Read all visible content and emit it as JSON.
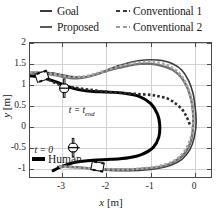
{
  "legend": {
    "items": [
      {
        "label": "Goal",
        "style": "solid",
        "color": "#3a3a3a",
        "icon": "line-solid-dark"
      },
      {
        "label": "Conventional 1",
        "style": "dashed",
        "color": "#3a3a3a",
        "icon": "line-dashed-dark"
      },
      {
        "label": "Proposed",
        "style": "solid",
        "color": "#5a5a5a",
        "icon": "line-solid-gray"
      },
      {
        "label": "Conventional 2",
        "style": "dashed",
        "color": "#9a9a9a",
        "icon": "line-dashed-gray"
      }
    ],
    "inline": {
      "label": "Human",
      "color": "#000000",
      "icon": "line-solid-black"
    }
  },
  "annotations": {
    "t_end": "t = t",
    "t_end_sub": "end",
    "t_zero": "t = 0"
  },
  "chart_data": {
    "type": "line",
    "title": "",
    "xlabel": "x [m]",
    "ylabel": "y [m]",
    "xlabel_sym": "x",
    "xlabel_unit": "[m]",
    "ylabel_sym": "y",
    "ylabel_unit": "[m]",
    "xlim": [
      -3.72,
      0.4
    ],
    "ylim": [
      -1.25,
      2.0
    ],
    "xticks": [
      -3,
      -2,
      -1,
      0
    ],
    "xticklabels": [
      "-3",
      "-2",
      "-1",
      "0"
    ],
    "yticks": [
      -1,
      -0.5,
      0,
      0.5,
      1,
      1.5,
      2
    ],
    "yticklabels": [
      "-1",
      "-0.5",
      "0",
      "0.5",
      "1",
      "1.5",
      "2"
    ],
    "grid": true,
    "legend_position": "above-plot",
    "series": [
      {
        "name": "Human",
        "color": "#000000",
        "style": "solid",
        "width": 3.0,
        "points": [
          [
            -3.72,
            1.22
          ],
          [
            -3.4,
            1.16
          ],
          [
            -3.1,
            1.06
          ],
          [
            -2.85,
            0.95
          ],
          [
            -2.6,
            0.88
          ],
          [
            -2.3,
            0.84
          ],
          [
            -2.0,
            0.83
          ],
          [
            -1.6,
            0.8
          ],
          [
            -1.25,
            0.72
          ],
          [
            -1.0,
            0.55
          ],
          [
            -0.85,
            0.3
          ],
          [
            -0.8,
            0.05
          ],
          [
            -0.82,
            -0.25
          ],
          [
            -0.95,
            -0.5
          ],
          [
            -1.2,
            -0.66
          ],
          [
            -1.5,
            -0.74
          ],
          [
            -1.9,
            -0.78
          ],
          [
            -2.3,
            -0.8
          ],
          [
            -2.7,
            -0.85
          ],
          [
            -3.0,
            -0.95
          ],
          [
            -3.2,
            -1.05
          ]
        ]
      },
      {
        "name": "Goal",
        "color": "#3a3a3a",
        "style": "solid",
        "width": 1.6,
        "points": [
          [
            -3.72,
            1.3
          ],
          [
            -3.45,
            1.3
          ],
          [
            -3.2,
            1.28
          ],
          [
            -3.0,
            1.24
          ],
          [
            -2.8,
            1.2
          ],
          [
            -2.6,
            1.18
          ],
          [
            -2.4,
            1.2
          ],
          [
            -2.2,
            1.26
          ],
          [
            -2.0,
            1.35
          ],
          [
            -1.75,
            1.45
          ],
          [
            -1.5,
            1.53
          ],
          [
            -1.25,
            1.58
          ],
          [
            -1.0,
            1.6
          ],
          [
            -0.75,
            1.58
          ],
          [
            -0.5,
            1.5
          ],
          [
            -0.3,
            1.35
          ],
          [
            -0.15,
            1.1
          ],
          [
            -0.05,
            0.8
          ],
          [
            0.0,
            0.45
          ],
          [
            0.02,
            0.1
          ],
          [
            -0.02,
            -0.25
          ],
          [
            -0.12,
            -0.55
          ],
          [
            -0.3,
            -0.78
          ],
          [
            -0.55,
            -0.92
          ],
          [
            -0.85,
            -1.0
          ],
          [
            -1.2,
            -1.04
          ],
          [
            -1.6,
            -1.05
          ],
          [
            -2.0,
            -1.04
          ],
          [
            -2.4,
            -1.0
          ],
          [
            -2.8,
            -0.95
          ],
          [
            -3.1,
            -0.95
          ]
        ]
      },
      {
        "name": "Proposed",
        "color": "#6e6e6e",
        "style": "dashed-dot",
        "width": 2.4,
        "points": [
          [
            -3.72,
            1.28
          ],
          [
            -3.45,
            1.27
          ],
          [
            -3.2,
            1.24
          ],
          [
            -3.0,
            1.2
          ],
          [
            -2.8,
            1.16
          ],
          [
            -2.6,
            1.16
          ],
          [
            -2.4,
            1.2
          ],
          [
            -2.2,
            1.26
          ],
          [
            -2.0,
            1.33
          ],
          [
            -1.75,
            1.4
          ],
          [
            -1.5,
            1.46
          ],
          [
            -1.25,
            1.5
          ],
          [
            -1.0,
            1.5
          ],
          [
            -0.78,
            1.46
          ],
          [
            -0.55,
            1.38
          ],
          [
            -0.35,
            1.22
          ],
          [
            -0.2,
            0.98
          ],
          [
            -0.1,
            0.68
          ],
          [
            -0.05,
            0.35
          ],
          [
            -0.05,
            0.0
          ],
          [
            -0.1,
            -0.35
          ],
          [
            -0.25,
            -0.65
          ],
          [
            -0.5,
            -0.85
          ],
          [
            -0.8,
            -0.96
          ],
          [
            -1.15,
            -1.0
          ],
          [
            -1.5,
            -1.02
          ],
          [
            -1.9,
            -1.02
          ],
          [
            -2.3,
            -1.0
          ],
          [
            -2.7,
            -0.97
          ],
          [
            -3.05,
            -0.95
          ]
        ]
      },
      {
        "name": "Conventional 1",
        "color": "#2c2c2c",
        "style": "dotted-square",
        "width": 2.6,
        "points": [
          [
            -3.3,
            1.12
          ],
          [
            -3.05,
            1.0
          ],
          [
            -2.8,
            0.95
          ],
          [
            -2.5,
            0.9
          ],
          [
            -2.2,
            0.86
          ],
          [
            -1.9,
            0.82
          ],
          [
            -1.6,
            0.8
          ],
          [
            -1.3,
            0.78
          ],
          [
            -1.0,
            0.76
          ],
          [
            -0.8,
            0.72
          ],
          [
            -0.6,
            0.66
          ],
          [
            -0.45,
            0.56
          ],
          [
            -0.3,
            0.42
          ],
          [
            -0.2,
            0.25
          ],
          [
            -0.12,
            0.05
          ]
        ]
      },
      {
        "name": "Conventional 2",
        "color": "#a5a5a5",
        "style": "dotted-square",
        "width": 2.6,
        "points": [
          [
            -3.72,
            1.3
          ],
          [
            -3.45,
            1.3
          ],
          [
            -3.2,
            1.26
          ],
          [
            -3.0,
            1.22
          ],
          [
            -2.8,
            1.19
          ],
          [
            -2.6,
            1.19
          ],
          [
            -2.4,
            1.22
          ],
          [
            -2.2,
            1.28
          ],
          [
            -2.0,
            1.35
          ],
          [
            -1.75,
            1.43
          ],
          [
            -1.5,
            1.5
          ],
          [
            -1.25,
            1.54
          ],
          [
            -1.0,
            1.55
          ],
          [
            -0.78,
            1.52
          ],
          [
            -0.55,
            1.43
          ],
          [
            -0.35,
            1.26
          ],
          [
            -0.2,
            1.02
          ],
          [
            -0.1,
            0.72
          ],
          [
            -0.05,
            0.38
          ],
          [
            -0.05,
            0.02
          ],
          [
            -0.12,
            -0.33
          ],
          [
            -0.28,
            -0.64
          ],
          [
            -0.52,
            -0.84
          ],
          [
            -0.85,
            -0.95
          ],
          [
            -1.2,
            -1.0
          ],
          [
            -1.55,
            -1.02
          ],
          [
            -1.95,
            -1.02
          ],
          [
            -2.35,
            -1.0
          ],
          [
            -2.75,
            -0.97
          ],
          [
            -3.1,
            -0.95
          ]
        ]
      }
    ],
    "markers": [
      {
        "name": "vehicle-icon-start-top",
        "x": -3.45,
        "y": 1.2,
        "type": "car"
      },
      {
        "name": "vehicle-icon-bottom",
        "x": -2.2,
        "y": -0.95,
        "type": "car"
      },
      {
        "name": "human-icon-t-end",
        "x": -2.95,
        "y": 0.92,
        "type": "human"
      },
      {
        "name": "human-icon-t-zero",
        "x": -2.75,
        "y": -0.5,
        "type": "human"
      }
    ]
  }
}
